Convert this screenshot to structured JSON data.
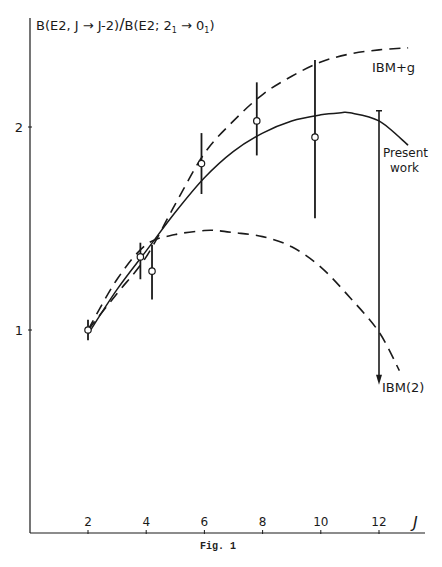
{
  "chart_data": {
    "type": "line",
    "xlabel": "J",
    "ylabel": "B(E2, J → J-2)/B(E2; 2₁ → 0₁)",
    "caption": "Fig. 1",
    "xlim": [
      0,
      13.2
    ],
    "ylim": [
      0,
      2.55
    ],
    "grid": false,
    "x_ticks": [
      2,
      4,
      6,
      8,
      10,
      12
    ],
    "x_tick_labels": [
      "2",
      "4",
      "6",
      "8",
      "10",
      "12"
    ],
    "y_ticks": [
      1,
      2
    ],
    "y_tick_labels": [
      "1",
      "2"
    ],
    "series": [
      {
        "name": "Present work",
        "style": "solid",
        "x": [
          2,
          3,
          4,
          5,
          6,
          7,
          8,
          9,
          10,
          10.7,
          11,
          12,
          13
        ],
        "y": [
          0.98,
          1.2,
          1.39,
          1.58,
          1.75,
          1.88,
          1.97,
          2.03,
          2.06,
          2.07,
          2.07,
          2.03,
          1.91
        ]
      },
      {
        "name": "IBM+g",
        "style": "dashed",
        "x": [
          2,
          3,
          4,
          5,
          6,
          7,
          8,
          9,
          10,
          11,
          12,
          13
        ],
        "y": [
          1.0,
          1.18,
          1.36,
          1.62,
          1.87,
          2.03,
          2.16,
          2.25,
          2.32,
          2.36,
          2.38,
          2.39
        ]
      },
      {
        "name": "IBM(2)",
        "style": "dashed",
        "x": [
          2,
          3,
          4,
          5,
          6,
          6.4,
          7,
          8,
          9,
          10,
          11,
          12,
          12.7
        ],
        "y": [
          1.0,
          1.25,
          1.42,
          1.47,
          1.49,
          1.49,
          1.48,
          1.46,
          1.41,
          1.31,
          1.16,
          0.99,
          0.8
        ]
      }
    ],
    "data_points": [
      {
        "J": 2.0,
        "value": 1.0,
        "err_low": 0.95,
        "err_high": 1.05
      },
      {
        "J": 3.8,
        "value": 1.36,
        "err_low": 1.25,
        "err_high": 1.43
      },
      {
        "J": 4.2,
        "value": 1.29,
        "err_low": 1.15,
        "err_high": 1.42
      },
      {
        "J": 5.9,
        "value": 1.82,
        "err_low": 1.67,
        "err_high": 1.97
      },
      {
        "J": 7.8,
        "value": 2.03,
        "err_low": 1.86,
        "err_high": 2.22
      },
      {
        "J": 9.8,
        "value": 1.95,
        "err_low": 1.55,
        "err_high": 2.33
      }
    ],
    "upper_limit_arrows": [
      {
        "J": 12.0,
        "from": 2.08,
        "to": 0.73
      }
    ],
    "annotations": [
      {
        "text": "IBM+g",
        "near_series": "IBM+g"
      },
      {
        "text": "Present work",
        "near_series": "Present work"
      },
      {
        "text": "IBM(2)",
        "near_series": "IBM(2)"
      }
    ]
  },
  "labels": {
    "title_part1": "B(E2, J → J-2)",
    "title_slash": "/",
    "title_part2": "B(E2; 2",
    "title_sub1": "1",
    "title_part3": " → 0",
    "title_sub2": "1",
    "title_close": ")",
    "x_axis_symbol": "J",
    "ibm_g": "IBM+g",
    "present_line1": "Present",
    "present_line2": "work",
    "ibm2": "IBM(2)",
    "caption": "Fig. 1"
  },
  "colors": {
    "ink": "#1a1a1a",
    "background": "#ffffff"
  }
}
